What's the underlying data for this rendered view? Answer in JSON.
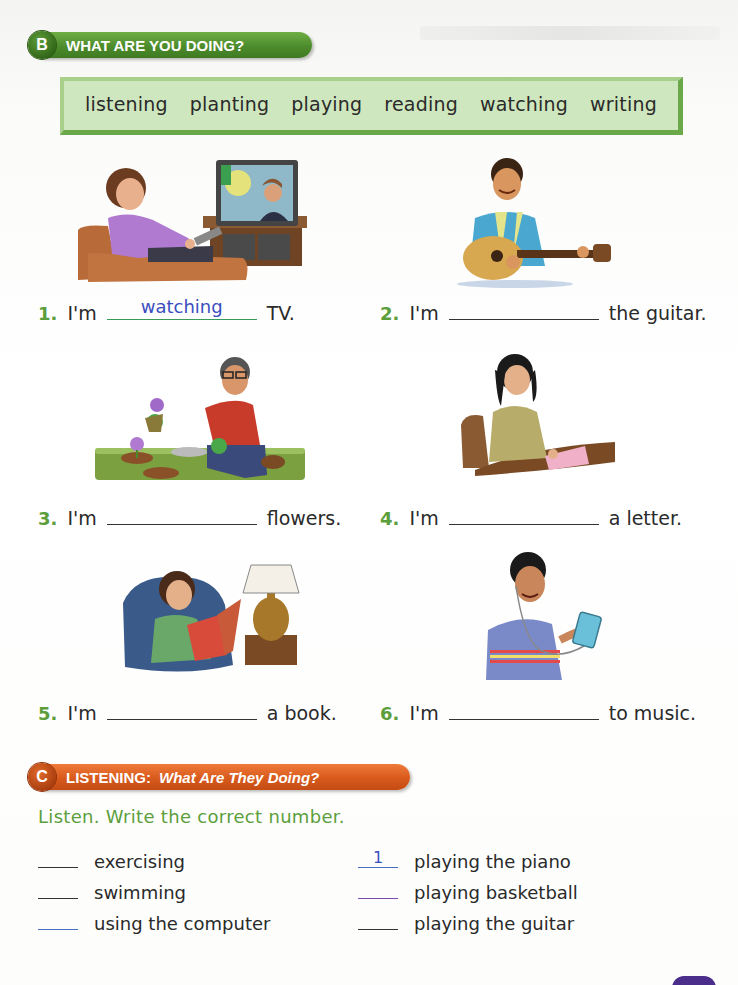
{
  "section_b": {
    "letter": "B",
    "title": "WHAT ARE YOU DOING?",
    "color": "#4d8c2c",
    "word_bank": [
      "listening",
      "planting",
      "playing",
      "reading",
      "watching",
      "writing"
    ],
    "exercises": [
      {
        "number": "1.",
        "prefix": "I'm",
        "answer": "watching",
        "suffix": "TV.",
        "illustration": "woman-watching-tv"
      },
      {
        "number": "2.",
        "prefix": "I'm",
        "answer": "",
        "suffix": "the guitar.",
        "illustration": "man-playing-guitar"
      },
      {
        "number": "3.",
        "prefix": "I'm",
        "answer": "",
        "suffix": "flowers.",
        "illustration": "man-planting-flowers"
      },
      {
        "number": "4.",
        "prefix": "I'm",
        "answer": "",
        "suffix": "a letter.",
        "illustration": "woman-writing-letter"
      },
      {
        "number": "5.",
        "prefix": "I'm",
        "answer": "",
        "suffix": "a book.",
        "illustration": "girl-reading-book"
      },
      {
        "number": "6.",
        "prefix": "I'm",
        "answer": "",
        "suffix": "to music.",
        "illustration": "boy-listening-music"
      }
    ]
  },
  "section_c": {
    "letter": "C",
    "title": "LISTENING:",
    "subtitle": "What Are They Doing?",
    "color": "#d85a1c",
    "instruction": "Listen.  Write the correct number.",
    "items_left": [
      {
        "answer": "",
        "label": "exercising"
      },
      {
        "answer": "",
        "label": "swimming"
      },
      {
        "answer": "",
        "label": "using the computer"
      }
    ],
    "items_right": [
      {
        "answer": "1",
        "label": "playing the piano"
      },
      {
        "answer": "",
        "label": "playing basketball"
      },
      {
        "answer": "",
        "label": "playing the guitar"
      }
    ]
  },
  "colors": {
    "number_green": "#5c9e3c",
    "answer_blue": "#3a4ec0",
    "word_box_bg": "#cfe7be",
    "page_tab": "#4b2d8c"
  }
}
